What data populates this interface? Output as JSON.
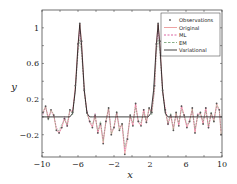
{
  "chart_data": {
    "type": "line",
    "title": "",
    "xlabel": "x",
    "ylabel": "y",
    "xlim": [
      -10,
      10
    ],
    "ylim": [
      -0.45,
      1.2
    ],
    "xticks": [
      -10,
      -6,
      -2,
      2,
      6,
      10
    ],
    "yticks": [
      -0.2,
      0.2,
      0.6,
      1
    ],
    "xtick_labels": [
      "−10",
      "−6",
      "−2",
      "2",
      "6",
      "10"
    ],
    "ytick_labels": [
      "−0.2",
      "0.2",
      "0.6",
      "1"
    ],
    "grid": false,
    "legend_position": "upper right",
    "legend": [
      "Observations",
      "Original",
      "ML",
      "EM",
      "Variational"
    ],
    "colors": {
      "observations": "#555555",
      "original": "#e88a8a",
      "ml": "#d23c8c",
      "em": "#6a9a6a",
      "variational": "#111111"
    },
    "peaks": [
      {
        "center": -5.8,
        "height": 1.05,
        "width_sigma": 0.45
      },
      {
        "center": 2.9,
        "height": 1.05,
        "width_sigma": 0.45
      }
    ],
    "series": [
      {
        "name": "Variational",
        "style": "solid black",
        "x": [
          -10,
          -6.9,
          -6.6,
          -6.3,
          -6.0,
          -5.8,
          -5.6,
          -5.3,
          -5.0,
          -4.7,
          -4.4,
          1.8,
          2.1,
          2.4,
          2.7,
          2.9,
          3.1,
          3.4,
          3.7,
          4.0,
          4.3,
          10
        ],
        "y": [
          0,
          0,
          0.04,
          0.3,
          0.8,
          1.04,
          0.8,
          0.3,
          0.04,
          0,
          0,
          0,
          0.04,
          0.3,
          0.8,
          1.04,
          0.8,
          0.3,
          0.04,
          0,
          0,
          0
        ]
      },
      {
        "name": "Observations",
        "style": "dot markers",
        "x": [
          -9.9,
          -9.6,
          -9.3,
          -9.0,
          -8.7,
          -8.4,
          -8.1,
          -7.8,
          -7.5,
          -7.2,
          -6.9,
          -6.6,
          -6.3,
          -6.0,
          -5.8,
          -5.6,
          -5.3,
          -5.0,
          -4.7,
          -4.4,
          -4.1,
          -3.8,
          -3.5,
          -3.2,
          -2.9,
          -2.6,
          -2.3,
          -2.0,
          -1.7,
          -1.4,
          -1.1,
          -0.8,
          -0.5,
          -0.2,
          0.1,
          0.4,
          0.7,
          1.0,
          1.3,
          1.6,
          1.9,
          2.2,
          2.5,
          2.7,
          2.9,
          3.1,
          3.4,
          3.7,
          4.0,
          4.3,
          4.6,
          4.9,
          5.2,
          5.5,
          5.8,
          6.1,
          6.4,
          6.7,
          7.0,
          7.3,
          7.6,
          7.9,
          8.2,
          8.5,
          8.8,
          9.1,
          9.4,
          9.7,
          9.9
        ],
        "y": [
          0.05,
          0.12,
          -0.02,
          0.08,
          0.02,
          -0.15,
          -0.18,
          -0.12,
          -0.02,
          -0.1,
          0.08,
          0.05,
          0.35,
          0.82,
          1.05,
          0.85,
          0.3,
          0.05,
          -0.05,
          -0.12,
          0.02,
          -0.18,
          -0.08,
          -0.3,
          -0.05,
          0.1,
          -0.2,
          -0.12,
          0.05,
          -0.15,
          -0.08,
          -0.42,
          -0.25,
          0.02,
          -0.1,
          0.15,
          -0.05,
          -0.1,
          0.08,
          -0.06,
          0.1,
          0.05,
          0.35,
          0.82,
          1.05,
          0.85,
          0.3,
          0.08,
          -0.08,
          0.02,
          -0.15,
          0.05,
          -0.1,
          0.12,
          0.02,
          -0.12,
          -0.05,
          0.1,
          -0.18,
          0.02,
          0.05,
          -0.08,
          0.1,
          -0.12,
          0.04,
          -0.05,
          0.15,
          0.08,
          -0.2
        ]
      }
    ]
  },
  "axes": {
    "xlabel": "x",
    "ylabel": "y"
  },
  "legend": {
    "items": [
      {
        "label": "Observations"
      },
      {
        "label": "Original"
      },
      {
        "label": "ML"
      },
      {
        "label": "EM"
      },
      {
        "label": "Variational"
      }
    ]
  }
}
